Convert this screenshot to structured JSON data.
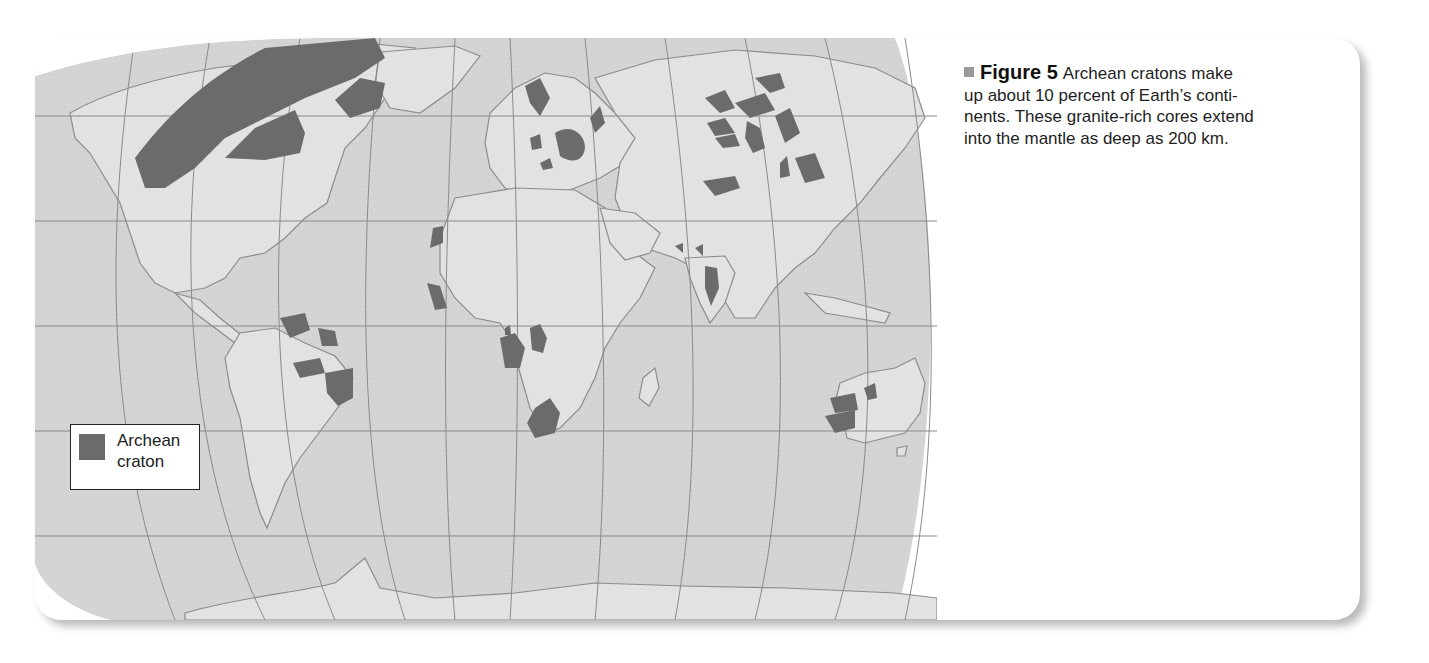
{
  "figure": {
    "label": "Figure 5",
    "caption": "Archean cratons make up about 10 percent of Earth’s conti-nents. These granite-rich cores extend into the mantle as deep as 200 km.",
    "caption_lines": [
      "Archean cratons make",
      "up about 10 percent of Earth’s conti-",
      "nents. These granite-rich cores extend",
      "into the mantle as deep as 200 km."
    ],
    "bullet_icon": "square-bullet-icon"
  },
  "legend": {
    "swatch_color": "#6b6b6b",
    "label_line1": "Archean",
    "label_line2": "craton"
  },
  "map": {
    "type": "world-map",
    "projection": "Robinson-like",
    "colors": {
      "ocean": "#d4d4d4",
      "land": "#e2e2e2",
      "craton": "#6b6b6b",
      "graticule": "#8a8a8a",
      "coast": "#8c8c8c"
    },
    "craton_regions": [
      "Canadian Shield (NW belt)",
      "Hudson Bay / Superior",
      "Greenland",
      "Baltic Shield",
      "East European",
      "Siberian",
      "Central Asia",
      "North China",
      "India",
      "West Africa",
      "Central Africa (Congo)",
      "East Africa (Tanzania)",
      "Southern Africa (Kaapvaal/Zimbabwe)",
      "Amazonian (Guiana)",
      "Amazonian (central)",
      "Sao Francisco",
      "Western Australia (Pilbara)",
      "Western Australia (Yilgarn)"
    ]
  }
}
